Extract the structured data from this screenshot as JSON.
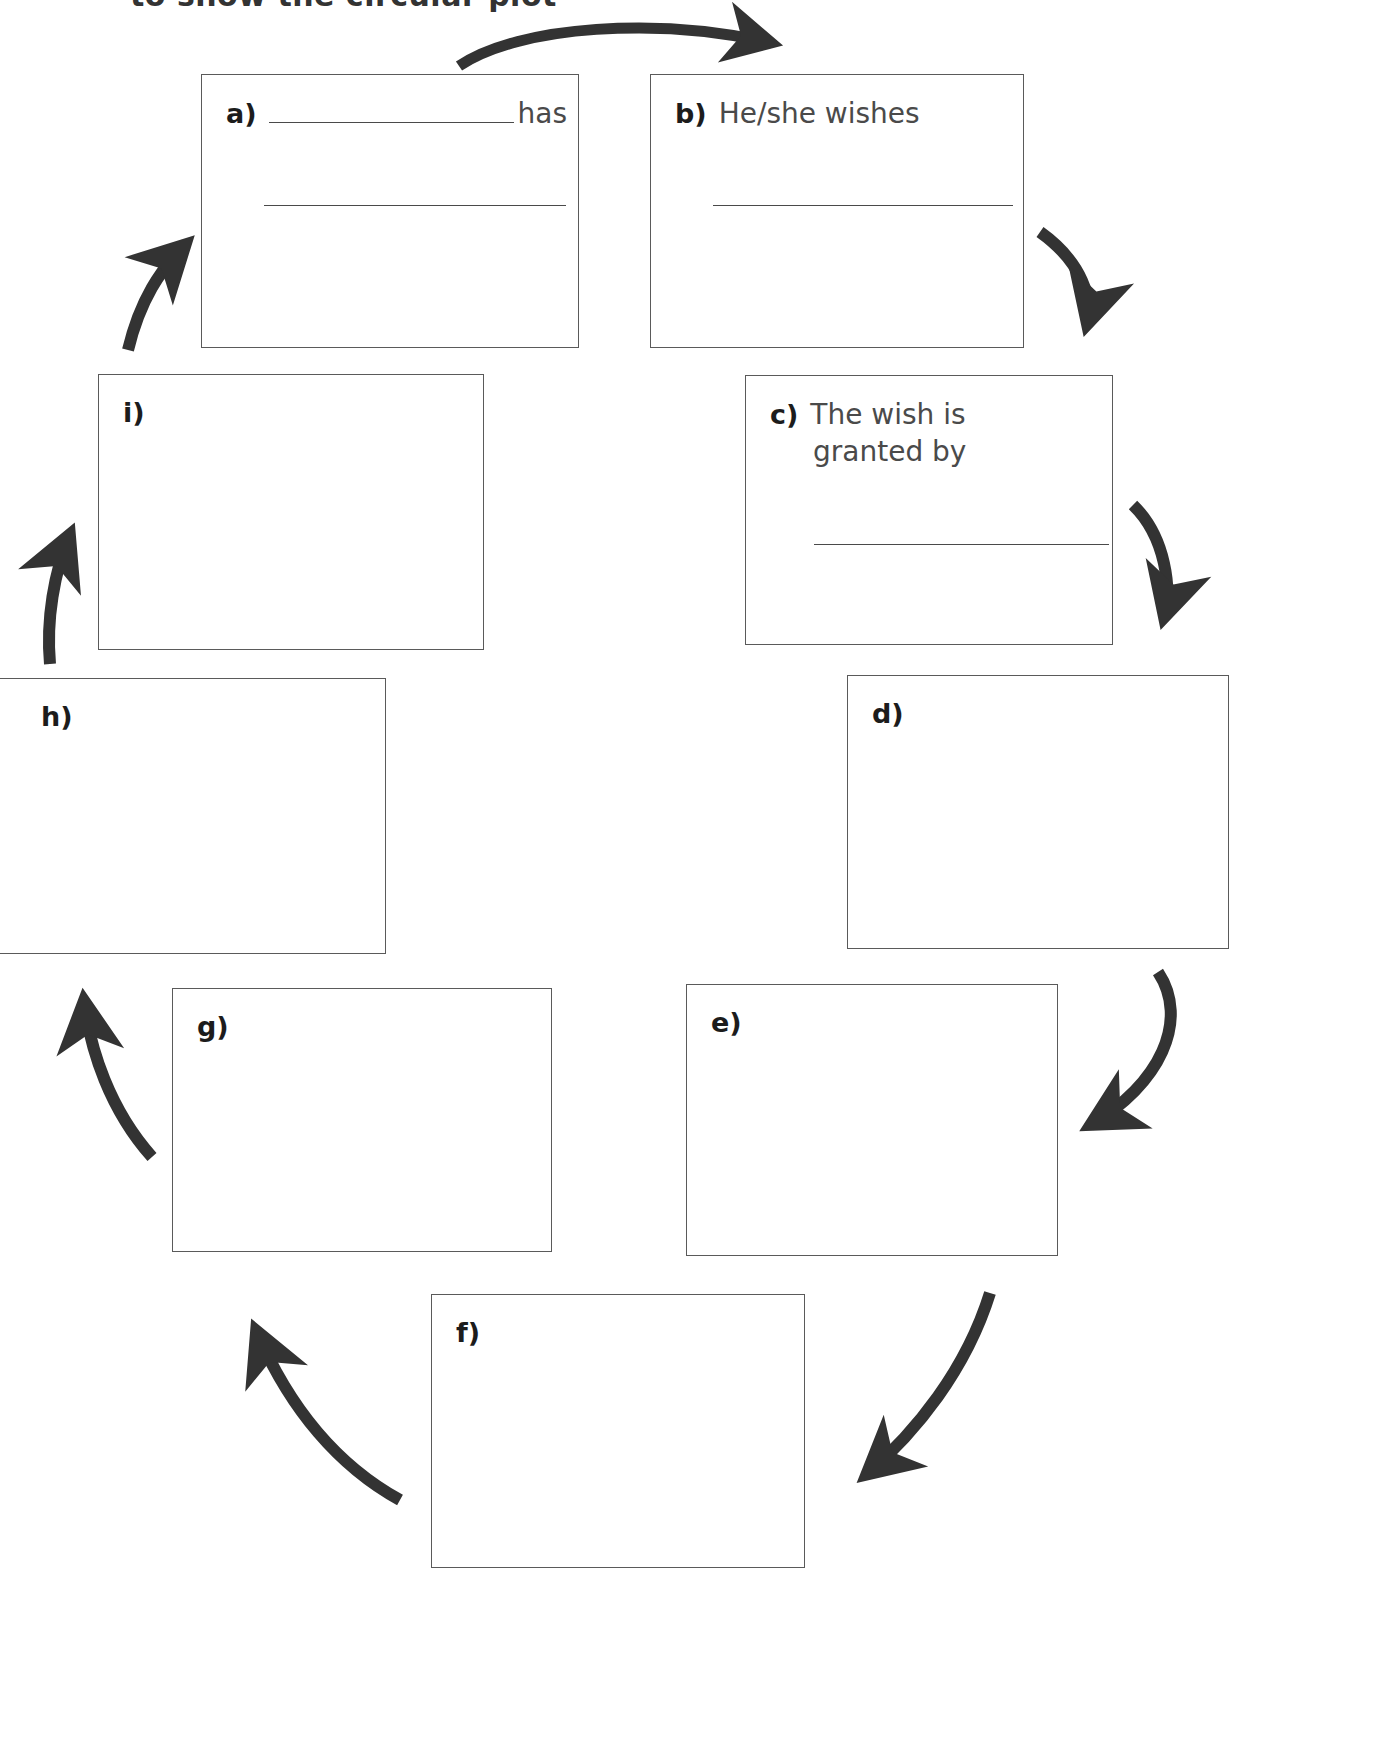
{
  "page": {
    "heading_clipped": "to show the circular plot",
    "ink_color": "#333333",
    "box_border_color": "#5a5a5a",
    "arrow_color": "#333333"
  },
  "boxes": [
    {
      "id": "a",
      "letter": "a)",
      "prompt": "",
      "prompt_line2": "",
      "trailing_word": "has",
      "has_inline_rule": true,
      "rules": 2
    },
    {
      "id": "b",
      "letter": "b)",
      "prompt": "He/she wishes",
      "prompt_line2": "",
      "trailing_word": "",
      "has_inline_rule": false,
      "rules": 1
    },
    {
      "id": "c",
      "letter": "c)",
      "prompt": "The wish is",
      "prompt_line2": "granted by",
      "trailing_word": "",
      "has_inline_rule": false,
      "rules": 1
    },
    {
      "id": "d",
      "letter": "d)",
      "prompt": "",
      "prompt_line2": "",
      "trailing_word": "",
      "has_inline_rule": false,
      "rules": 0
    },
    {
      "id": "e",
      "letter": "e)",
      "prompt": "",
      "prompt_line2": "",
      "trailing_word": "",
      "has_inline_rule": false,
      "rules": 0
    },
    {
      "id": "f",
      "letter": "f)",
      "prompt": "",
      "prompt_line2": "",
      "trailing_word": "",
      "has_inline_rule": false,
      "rules": 0
    },
    {
      "id": "g",
      "letter": "g)",
      "prompt": "",
      "prompt_line2": "",
      "trailing_word": "",
      "has_inline_rule": false,
      "rules": 0
    },
    {
      "id": "h",
      "letter": "h)",
      "prompt": "",
      "prompt_line2": "",
      "trailing_word": "",
      "has_inline_rule": false,
      "rules": 0
    },
    {
      "id": "i",
      "letter": "i)",
      "prompt": "",
      "prompt_line2": "",
      "trailing_word": "",
      "has_inline_rule": false,
      "rules": 0
    }
  ],
  "arrows": [
    {
      "from": "a",
      "to": "b",
      "name": "arrow-a-to-b"
    },
    {
      "from": "b",
      "to": "c",
      "name": "arrow-b-to-c"
    },
    {
      "from": "c",
      "to": "d",
      "name": "arrow-c-to-d"
    },
    {
      "from": "d",
      "to": "e",
      "name": "arrow-d-to-e"
    },
    {
      "from": "e",
      "to": "f",
      "name": "arrow-e-to-f"
    },
    {
      "from": "f",
      "to": "g",
      "name": "arrow-f-to-g"
    },
    {
      "from": "g",
      "to": "h",
      "name": "arrow-g-to-h"
    },
    {
      "from": "h",
      "to": "i",
      "name": "arrow-h-to-i"
    },
    {
      "from": "i",
      "to": "a",
      "name": "arrow-i-to-a"
    }
  ]
}
